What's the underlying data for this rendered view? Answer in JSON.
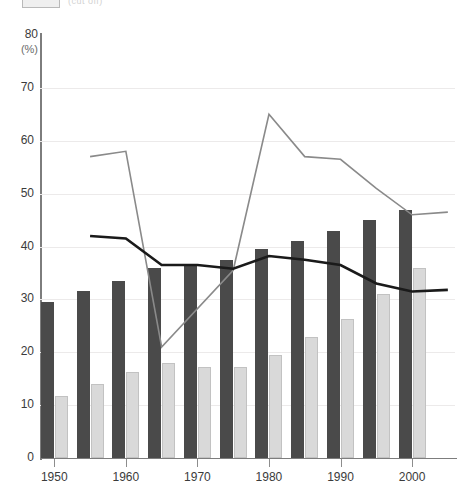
{
  "legend": {
    "swatch_name": "legend-swatch",
    "label": "(cut off)"
  },
  "axis": {
    "y_title": "80",
    "y_unit": "(%)",
    "y_ticks": [
      "80",
      "70",
      "60",
      "50",
      "40",
      "30",
      "20",
      "10",
      "0"
    ],
    "x_ticks": [
      "1950",
      "1960",
      "1970",
      "1980",
      "1990",
      "2000"
    ]
  },
  "colors": {
    "bar_dark": "#4a4a4a",
    "bar_light": "#d9d9d9",
    "line_gray": "#8a8a8a",
    "line_black": "#1a1a1a",
    "grid": "#eceaea",
    "axis": "#7d7d7d"
  },
  "chart_data": {
    "type": "bar",
    "title": "",
    "xlabel": "",
    "ylabel": "(%)",
    "ylim": [
      0,
      80
    ],
    "xlim": [
      1948,
      2006
    ],
    "grid": true,
    "legend_position": "top-left",
    "categories": [
      1950,
      1955,
      1960,
      1965,
      1970,
      1975,
      1980,
      1985,
      1990,
      1995,
      2000
    ],
    "tick_categories": [
      1950,
      1960,
      1970,
      1980,
      1990,
      2000
    ],
    "series": [
      {
        "name": "dark-bars",
        "type": "bar",
        "color": "#4a4a4a",
        "values": [
          29.5,
          31.5,
          33.5,
          36.0,
          36.5,
          37.5,
          39.5,
          41.0,
          43.0,
          45.0,
          47.0
        ]
      },
      {
        "name": "light-bars",
        "type": "bar",
        "color": "#d9d9d9",
        "values": [
          11.8,
          14.0,
          16.2,
          18.0,
          17.3,
          17.3,
          19.5,
          22.8,
          26.3,
          31.0,
          36.0
        ]
      },
      {
        "name": "gray-line",
        "type": "line",
        "color": "#8a8a8a",
        "x": [
          1955,
          1960,
          1965,
          1975,
          1980,
          1985,
          1990,
          1995,
          2000,
          2005
        ],
        "values": [
          57.0,
          58.0,
          21.0,
          35.5,
          65.0,
          57.0,
          56.5,
          51.0,
          46.0,
          46.5
        ]
      },
      {
        "name": "black-line",
        "type": "line",
        "color": "#1a1a1a",
        "x": [
          1955,
          1960,
          1965,
          1970,
          1975,
          1980,
          1985,
          1990,
          1995,
          2000,
          2005
        ],
        "values": [
          42.0,
          41.5,
          36.5,
          36.5,
          35.8,
          38.2,
          37.5,
          36.5,
          33.0,
          31.5,
          31.8
        ]
      }
    ]
  }
}
